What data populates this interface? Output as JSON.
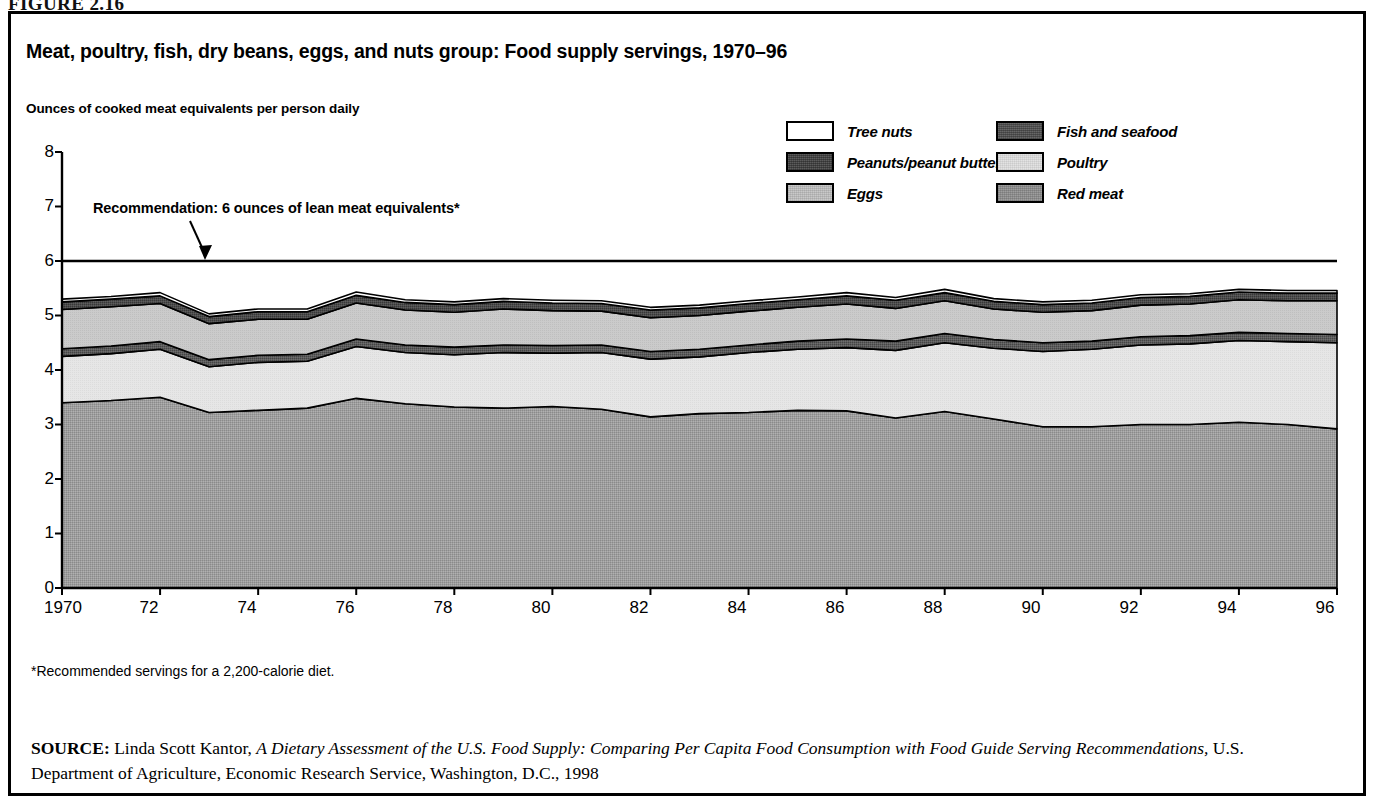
{
  "figure_number": "FIGURE 2.16",
  "title": "Meat, poultry, fish, dry beans, eggs, and nuts group: Food supply servings, 1970–96",
  "axis_title": "Ounces of cooked meat equivalents per person daily",
  "annotation": "Recommendation: 6 ounces of lean meat equivalents*",
  "footnote": "*Recommended servings for a 2,200-calorie diet.",
  "source": {
    "label": "SOURCE:",
    "author": " Linda Scott Kantor, ",
    "work": "A Dietary Assessment of the U.S. Food Supply: Comparing Per Capita Food Consumption with Food Guide Serving Recommendations,",
    "publisher": " U.S. Department of Agriculture, Economic Research Service, Washington, D.C., 1998"
  },
  "legend": {
    "items": [
      {
        "label": "Tree nuts",
        "swatch": "fill-treenuts",
        "color": "#ffffff",
        "col": 0,
        "row": 0
      },
      {
        "label": "Peanuts/peanut butter",
        "swatch": "fill-peanuts",
        "color": "#4a4a4a",
        "col": 0,
        "row": 1
      },
      {
        "label": "Eggs",
        "swatch": "fill-eggs",
        "color": "#c9c9c9",
        "col": 0,
        "row": 2
      },
      {
        "label": "Fish and seafood",
        "swatch": "fill-fish",
        "color": "#585858",
        "col": 1,
        "row": 0
      },
      {
        "label": "Poultry",
        "swatch": "fill-poultry",
        "color": "#e3e3e3",
        "col": 1,
        "row": 1
      },
      {
        "label": "Red meat",
        "swatch": "fill-redmeat",
        "color": "#9e9e9e",
        "col": 1,
        "row": 2
      }
    ]
  },
  "chart_data": {
    "type": "area",
    "stacked": true,
    "title": "Meat, poultry, fish, dry beans, eggs, and nuts group: Food supply servings, 1970–96",
    "xlabel": "",
    "ylabel": "Ounces of cooked meat equivalents per person daily",
    "ylim": [
      0,
      8
    ],
    "xlim": [
      1970,
      1996
    ],
    "ytick_labels": [
      "0",
      "1",
      "2",
      "3",
      "4",
      "5",
      "6",
      "7",
      "8"
    ],
    "yticks": [
      0,
      1,
      2,
      3,
      4,
      5,
      6,
      7,
      8
    ],
    "xtick_labels": [
      "1970",
      "72",
      "74",
      "76",
      "78",
      "80",
      "82",
      "84",
      "86",
      "88",
      "90",
      "92",
      "94",
      "96"
    ],
    "xticks": [
      1970,
      1972,
      1974,
      1976,
      1978,
      1980,
      1982,
      1984,
      1986,
      1988,
      1990,
      1992,
      1994,
      1996
    ],
    "grid": false,
    "legend_position": "top-right",
    "x": [
      1970,
      1971,
      1972,
      1973,
      1974,
      1975,
      1976,
      1977,
      1978,
      1979,
      1980,
      1981,
      1982,
      1983,
      1984,
      1985,
      1986,
      1987,
      1988,
      1989,
      1990,
      1991,
      1992,
      1993,
      1994,
      1995,
      1996
    ],
    "series": [
      {
        "name": "Red meat",
        "color": "#9e9e9e",
        "stack_order": 1,
        "values": [
          3.4,
          3.44,
          3.5,
          3.22,
          3.26,
          3.3,
          3.48,
          3.38,
          3.32,
          3.3,
          3.33,
          3.28,
          3.14,
          3.2,
          3.22,
          3.26,
          3.25,
          3.12,
          3.24,
          3.1,
          2.96,
          2.96,
          3.0,
          3.0,
          3.04,
          3.0,
          2.92
        ]
      },
      {
        "name": "Poultry",
        "color": "#e3e3e3",
        "stack_order": 2,
        "values": [
          0.85,
          0.86,
          0.88,
          0.84,
          0.88,
          0.86,
          0.95,
          0.94,
          0.96,
          1.02,
          0.98,
          1.04,
          1.06,
          1.04,
          1.1,
          1.12,
          1.16,
          1.24,
          1.26,
          1.3,
          1.38,
          1.42,
          1.46,
          1.48,
          1.5,
          1.52,
          1.58
        ]
      },
      {
        "name": "Fish and seafood",
        "color": "#585858",
        "stack_order": 3,
        "values": [
          0.14,
          0.14,
          0.14,
          0.13,
          0.13,
          0.13,
          0.14,
          0.14,
          0.14,
          0.14,
          0.14,
          0.14,
          0.14,
          0.14,
          0.14,
          0.15,
          0.16,
          0.17,
          0.17,
          0.16,
          0.16,
          0.15,
          0.15,
          0.15,
          0.15,
          0.15,
          0.15
        ]
      },
      {
        "name": "Eggs",
        "color": "#c9c9c9",
        "stack_order": 4,
        "values": [
          0.72,
          0.72,
          0.7,
          0.66,
          0.66,
          0.64,
          0.66,
          0.64,
          0.64,
          0.66,
          0.64,
          0.62,
          0.62,
          0.62,
          0.62,
          0.62,
          0.64,
          0.6,
          0.6,
          0.56,
          0.56,
          0.56,
          0.58,
          0.58,
          0.6,
          0.6,
          0.62
        ]
      },
      {
        "name": "Peanuts/peanut butter",
        "color": "#4a4a4a",
        "stack_order": 5,
        "values": [
          0.14,
          0.14,
          0.14,
          0.13,
          0.14,
          0.14,
          0.14,
          0.14,
          0.14,
          0.14,
          0.14,
          0.14,
          0.14,
          0.14,
          0.14,
          0.14,
          0.15,
          0.15,
          0.15,
          0.14,
          0.14,
          0.14,
          0.14,
          0.14,
          0.14,
          0.14,
          0.14
        ]
      },
      {
        "name": "Tree nuts",
        "color": "#ffffff",
        "stack_order": 6,
        "values": [
          0.05,
          0.05,
          0.06,
          0.05,
          0.05,
          0.05,
          0.06,
          0.05,
          0.05,
          0.05,
          0.05,
          0.05,
          0.05,
          0.05,
          0.05,
          0.05,
          0.06,
          0.05,
          0.06,
          0.05,
          0.05,
          0.05,
          0.05,
          0.05,
          0.05,
          0.05,
          0.05
        ]
      }
    ],
    "reference_line": {
      "value": 6,
      "label": "Recommendation: 6 ounces of lean meat equivalents*"
    }
  }
}
